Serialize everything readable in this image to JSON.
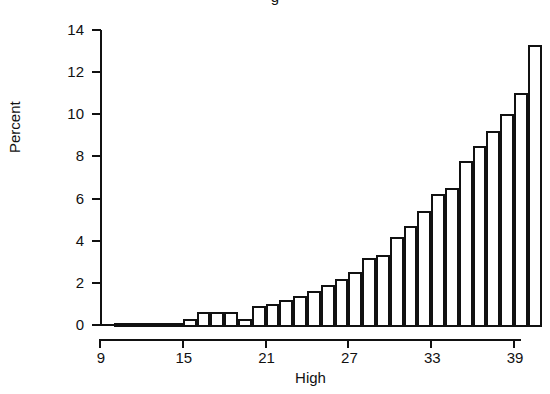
{
  "chart_data": {
    "type": "bar",
    "title": "g",
    "xlabel": "High",
    "ylabel": "Percent",
    "ylim": [
      0,
      14
    ],
    "xlim": [
      9,
      39.5
    ],
    "grid": false,
    "legend": null,
    "y_ticks": [
      0,
      2,
      4,
      6,
      8,
      10,
      12,
      14
    ],
    "y_tick_labels": [
      "0",
      "2",
      "4",
      "6",
      "8",
      "10",
      "12",
      "14"
    ],
    "x_ticks": [
      9,
      15,
      21,
      27,
      33,
      39
    ],
    "x_tick_labels": [
      "9",
      "15",
      "21",
      "27",
      "33",
      "39"
    ],
    "bar_width": 1,
    "categories": [
      10,
      11,
      12,
      13,
      14,
      15,
      16,
      17,
      18,
      19,
      20,
      21,
      22,
      23,
      24,
      25,
      26,
      27,
      28,
      29,
      30,
      31,
      32,
      33,
      34,
      35,
      36,
      37,
      38,
      39
    ],
    "values": [
      0.1,
      0.1,
      0.1,
      0.1,
      0.1,
      0.3,
      0.6,
      0.6,
      0.6,
      0.3,
      0.9,
      1.0,
      1.2,
      1.4,
      1.6,
      1.9,
      2.2,
      2.5,
      3.2,
      3.3,
      4.2,
      4.7,
      5.4,
      6.2,
      6.5,
      7.8,
      8.5,
      9.2,
      10.0,
      11.0
    ],
    "last_value": 13.3,
    "series_name": "Percent"
  },
  "axis": {
    "y_title": "Percent",
    "x_title": "High"
  }
}
